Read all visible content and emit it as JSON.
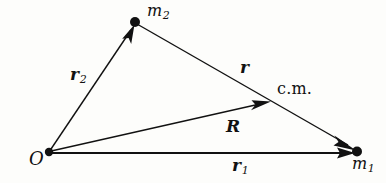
{
  "figure": {
    "kind": "vector-diagram",
    "background_color": "#fdfdfb",
    "ink_color": "#111111"
  },
  "points": {
    "origin": {
      "label": "O",
      "x": 49,
      "y": 152
    },
    "mass1": {
      "label": "m",
      "subscript": "1",
      "x": 357,
      "y": 152
    },
    "mass2": {
      "label": "m",
      "subscript": "2",
      "x": 135,
      "y": 22
    },
    "center_of_mass": {
      "label": "c.m.",
      "x": 284,
      "y": 96
    }
  },
  "vectors": [
    {
      "name": "r1",
      "label": "r",
      "subscript": "1",
      "from": "origin",
      "to": "mass1",
      "x1": 49,
      "y1": 153,
      "x2": 357,
      "y2": 153
    },
    {
      "name": "r2",
      "label": "r",
      "subscript": "2",
      "from": "origin",
      "to": "mass2",
      "x1": 49,
      "y1": 152,
      "x2": 135,
      "y2": 24
    },
    {
      "name": "R",
      "label": "R",
      "subscript": "",
      "from": "origin",
      "to": "center_of_mass",
      "x1": 49,
      "y1": 151,
      "x2": 271,
      "y2": 101
    },
    {
      "name": "r",
      "label": "r",
      "subscript": "",
      "from": "mass2",
      "to": "mass1",
      "x1": 137,
      "y1": 24,
      "x2": 357,
      "y2": 151
    }
  ],
  "labels": {
    "origin": "O",
    "mass1_base": "m",
    "mass1_sub": "1",
    "mass2_base": "m",
    "mass2_sub": "2",
    "center_of_mass": "c.m.",
    "vec_r": "r",
    "vec_R": "R",
    "vec_r1_base": "r",
    "vec_r1_sub": "1",
    "vec_r2_base": "r",
    "vec_r2_sub": "2"
  }
}
